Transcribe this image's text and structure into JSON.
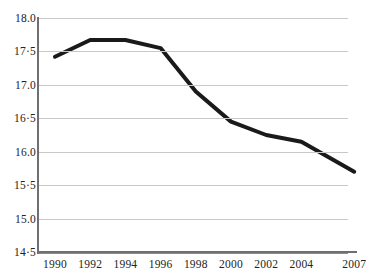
{
  "chart_data": {
    "type": "line",
    "title": "",
    "subtitle": "",
    "xlabel": "",
    "ylabel": "",
    "x": [
      1990,
      1992,
      1994,
      1996,
      1998,
      2000,
      2002,
      2004,
      2007
    ],
    "categories": [
      "1990",
      "1992",
      "1994",
      "1996",
      "1998",
      "2000",
      "2002",
      "2004",
      "2007"
    ],
    "values": [
      17.42,
      17.67,
      17.67,
      17.55,
      16.9,
      16.45,
      16.25,
      16.15,
      15.7
    ],
    "series": [
      {
        "name": "",
        "values": [
          17.42,
          17.67,
          17.67,
          17.55,
          16.9,
          16.45,
          16.25,
          16.15,
          15.7
        ]
      }
    ],
    "ylim": [
      14.5,
      18.0
    ],
    "xlim": [
      1990,
      2007
    ],
    "ytick_values": [
      18.0,
      17.5,
      17.0,
      16.5,
      16.0,
      15.5,
      15.0,
      14.5
    ],
    "ytick_labels": [
      "18.0",
      "17·5",
      "17.0",
      "16·5",
      "16.0",
      "15·5",
      "15.0",
      "14·5"
    ],
    "xtick_labels": [
      "1990",
      "1992",
      "1994",
      "1996",
      "1998",
      "2000",
      "2002",
      "2004",
      "2007"
    ],
    "grid": true,
    "grid_axis": "y",
    "legend": false,
    "legend_position": "none",
    "line_color": "#1a1a1a",
    "grid_color": "#c8c8c8",
    "axis_color": "#6f6f6f",
    "background_color": "#ffffff"
  }
}
